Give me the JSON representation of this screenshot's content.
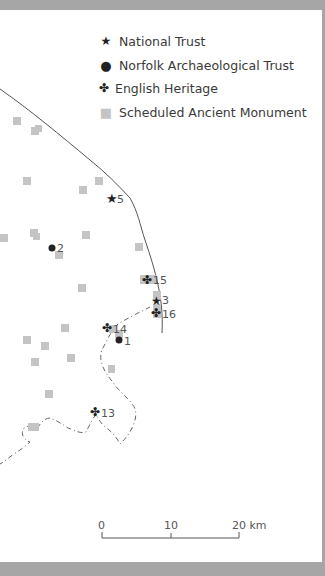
{
  "legend": {
    "items": [
      {
        "symbol": "star-icon",
        "glyph": "★",
        "label": "National Trust"
      },
      {
        "symbol": "dot-icon",
        "glyph": "●",
        "label": "Norfolk Archaeological Trust"
      },
      {
        "symbol": "clover-icon",
        "glyph": "✤",
        "label": "English Heritage"
      },
      {
        "symbol": "square-icon",
        "glyph": "■",
        "label": "Scheduled Ancient Monument"
      }
    ]
  },
  "sites": [
    {
      "id": "5",
      "type": "National Trust"
    },
    {
      "id": "3",
      "type": "National Trust"
    },
    {
      "id": "2",
      "type": "Norfolk Archaeological Trust"
    },
    {
      "id": "1",
      "type": "Norfolk Archaeological Trust"
    },
    {
      "id": "15",
      "type": "English Heritage"
    },
    {
      "id": "16",
      "type": "English Heritage"
    },
    {
      "id": "14",
      "type": "English Heritage"
    },
    {
      "id": "13",
      "type": "English Heritage"
    }
  ],
  "labels": {
    "s5": "5",
    "s3": "3",
    "s2": "2",
    "s1": "1",
    "s15": "15",
    "s16": "16",
    "s14": "14",
    "s13": "13"
  },
  "scale": {
    "ticks": [
      "0",
      "10",
      "20 km"
    ],
    "unit": "km"
  },
  "colors": {
    "background_frame": "#a6a6a6",
    "page": "#ffffff",
    "symbol": "#222222",
    "monument": "#c4c4c4",
    "coastline": "#555555"
  }
}
